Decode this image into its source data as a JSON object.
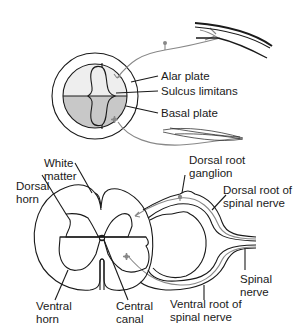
{
  "colors": {
    "outline": "#1a1a1a",
    "alar_fill": "#eeeeee",
    "basal_fill": "#c8c8c8",
    "nerve_gray": "#888888",
    "background": "#ffffff"
  },
  "top_diagram": {
    "labels": {
      "alar_plate": "Alar plate",
      "sulcus_limitans": "Sulcus limitans",
      "basal_plate": "Basal plate"
    }
  },
  "bottom_diagram": {
    "labels": {
      "white_matter_1": "White",
      "white_matter_2": "matter",
      "dorsal_horn_1": "Dorsal",
      "dorsal_horn_2": "horn",
      "dorsal_root_ganglion_1": "Dorsal root",
      "dorsal_root_ganglion_2": "ganglion",
      "dorsal_root_spinal_nerve_1": "Dorsal root of",
      "dorsal_root_spinal_nerve_2": "spinal nerve",
      "spinal_nerve_1": "Spinal",
      "spinal_nerve_2": "nerve",
      "ventral_horn_1": "Ventral",
      "ventral_horn_2": "horn",
      "central_canal_1": "Central",
      "central_canal_2": "canal",
      "ventral_root_spinal_nerve_1": "Ventral root of",
      "ventral_root_spinal_nerve_2": "spinal nerve"
    }
  }
}
